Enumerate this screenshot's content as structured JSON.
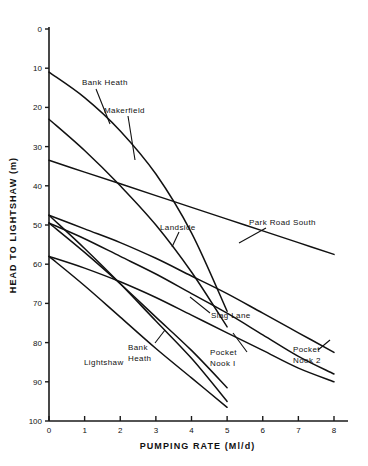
{
  "chart_data": {
    "type": "line",
    "title": "",
    "xlabel": "PUMPING RATE (Ml/d)",
    "ylabel": "HEAD TO LIGHTSHAW (m)",
    "xlim": [
      0,
      8
    ],
    "ylim": [
      0,
      100
    ],
    "y_axis_inverted": true,
    "grid": false,
    "legend_position": "inline-annotations",
    "xticks": [
      "0",
      "1",
      "2",
      "3",
      "4",
      "5",
      "6",
      "7",
      "8"
    ],
    "yticks": [
      "0",
      "10",
      "20",
      "30",
      "40",
      "50",
      "60",
      "70",
      "80",
      "90",
      "100"
    ],
    "series": [
      {
        "name": "Bank Heath",
        "label_position": "upper",
        "x": [
          0,
          1,
          2,
          3,
          4,
          5
        ],
        "y": [
          11,
          17.5,
          26,
          37,
          52,
          72
        ]
      },
      {
        "name": "Makerfield",
        "label_position": "upper",
        "x": [
          0,
          1,
          2,
          3,
          4,
          5
        ],
        "y": [
          23,
          31,
          40,
          50,
          62,
          76
        ]
      },
      {
        "name": "Landside",
        "label_position": "middle",
        "x": [
          0,
          1,
          2,
          3,
          4,
          5,
          6,
          7,
          8
        ],
        "y": [
          33.5,
          36.5,
          39.5,
          42.5,
          45.5,
          48.5,
          51.5,
          54.5,
          57.5
        ]
      },
      {
        "name": "Park Road South",
        "label_position": "right",
        "x": [
          0,
          1,
          2,
          3,
          4,
          5,
          6,
          7,
          8
        ],
        "y": [
          47.5,
          51,
          54.5,
          58.5,
          63,
          67.5,
          72.5,
          77.5,
          82.5
        ]
      },
      {
        "name": "Slag Lane",
        "label_position": "right",
        "x": [
          0,
          1,
          2,
          3,
          4,
          5,
          6,
          7,
          8
        ],
        "y": [
          49.5,
          53.5,
          58,
          62.5,
          67.5,
          72.5,
          78,
          83.5,
          88
        ]
      },
      {
        "name": "Pocket Nook 2",
        "label_position": "right",
        "x": [
          0,
          1,
          2,
          3,
          4,
          5,
          6,
          7,
          8
        ],
        "y": [
          58,
          61,
          64.5,
          68.5,
          73,
          77.5,
          82,
          86.5,
          90
        ]
      },
      {
        "name": "Pocket Nook 1",
        "label_position": "lower",
        "x": [
          0,
          1,
          2,
          3,
          4,
          5
        ],
        "y": [
          49.5,
          57,
          65,
          73.5,
          82,
          91.5
        ]
      },
      {
        "name": "Bank Heath",
        "label_position": "lower",
        "x": [
          0,
          1,
          2,
          3,
          4,
          5
        ],
        "y": [
          47.5,
          56,
          65,
          74.5,
          84,
          95
        ]
      },
      {
        "name": "Lightshaw",
        "label_position": "lower-left",
        "x": [
          0,
          1,
          2,
          3,
          4,
          5
        ],
        "y": [
          58,
          65.5,
          73.5,
          81.5,
          89,
          96.5
        ]
      }
    ],
    "annotations": [
      {
        "text": "Bank Heath",
        "x": 82,
        "y": 85
      },
      {
        "text": "Makerfield",
        "x": 104,
        "y": 113
      },
      {
        "text": "Landside",
        "x": 160,
        "y": 230
      },
      {
        "text": "Park Road South",
        "x": 249,
        "y": 225
      },
      {
        "text": "Slag Lane",
        "x": 211,
        "y": 318
      },
      {
        "text": "Bank",
        "x": 128,
        "y": 350
      },
      {
        "text": "Heath",
        "x": 128,
        "y": 361
      },
      {
        "text": "Pocket",
        "x": 210,
        "y": 355
      },
      {
        "text": "Nook I",
        "x": 210,
        "y": 366
      },
      {
        "text": "Pocket",
        "x": 293,
        "y": 352
      },
      {
        "text": "Nook 2",
        "x": 293,
        "y": 363
      },
      {
        "text": "Lightshaw",
        "x": 84,
        "y": 365
      }
    ]
  }
}
